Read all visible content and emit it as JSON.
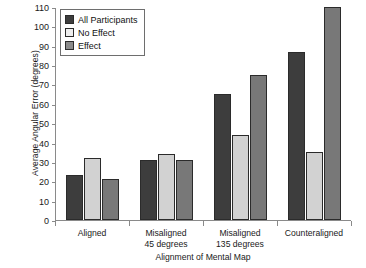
{
  "chart_data": {
    "type": "bar",
    "title": "",
    "xlabel": "Alignment of Mental Map",
    "ylabel": "Average Angular Error (degrees)",
    "categories": [
      "Aligned",
      "Misaligned 45 degrees",
      "Misaligned 135 degrees",
      "Counteraligned"
    ],
    "category_lines": [
      [
        "Aligned"
      ],
      [
        "Misaligned",
        "45 degrees"
      ],
      [
        "Misaligned",
        "135 degrees"
      ],
      [
        "Counteraligned"
      ]
    ],
    "series": [
      {
        "name": "All Participants",
        "color": "#3d3d3d",
        "values": [
          23,
          31,
          65,
          87
        ]
      },
      {
        "name": "No Effect",
        "color": "#d2d2d2",
        "values": [
          32,
          34,
          44,
          35
        ]
      },
      {
        "name": "Effect",
        "color": "#787878",
        "values": [
          21,
          31,
          75,
          110
        ]
      }
    ],
    "ylim": [
      0,
      110
    ],
    "ytick_step": 10,
    "yticks": [
      0,
      10,
      20,
      30,
      40,
      50,
      60,
      70,
      80,
      90,
      100,
      110
    ],
    "grid": false,
    "legend_position": "top-left"
  }
}
